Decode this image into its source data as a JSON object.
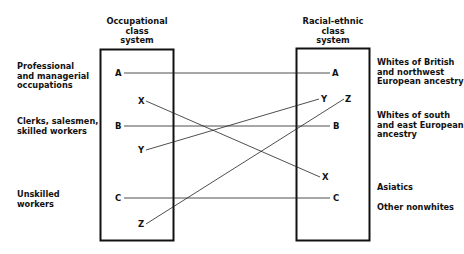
{
  "left_system": {
    "title": [
      "Occupational",
      "class",
      "system"
    ],
    "categories": [
      {
        "lines": [
          "Professional",
          "and managerial",
          "occupations"
        ]
      },
      {
        "lines": [
          "Clerks, salesmen,",
          "skilled workers"
        ]
      },
      {
        "lines": [
          "Unskilled",
          "workers"
        ]
      }
    ],
    "nodes": {
      "A": "A",
      "X": "X",
      "B": "B",
      "Y": "Y",
      "C": "C",
      "Z": "Z"
    }
  },
  "right_system": {
    "title": [
      "Racial-ethnic",
      "class",
      "system"
    ],
    "categories": [
      {
        "lines": [
          "Whites of British",
          "and northwest",
          "European ancestry"
        ]
      },
      {
        "lines": [
          "Whites of south",
          "and east European",
          "ancestry"
        ]
      },
      {
        "lines": [
          "Asiatics"
        ]
      },
      {
        "lines": [
          "Other nonwhites"
        ]
      }
    ],
    "nodes": {
      "A": "A",
      "Y": "Y",
      "Z": "Z",
      "B": "B",
      "X": "X",
      "C": "C"
    }
  },
  "connections": [
    {
      "from": "A",
      "to": "A"
    },
    {
      "from": "X",
      "to": "X"
    },
    {
      "from": "B",
      "to": "B"
    },
    {
      "from": "Y",
      "to": "Y"
    },
    {
      "from": "C",
      "to": "C"
    },
    {
      "from": "Z",
      "to": "Z"
    }
  ],
  "colors": {
    "ink": "#111111",
    "background": "#ffffff"
  }
}
